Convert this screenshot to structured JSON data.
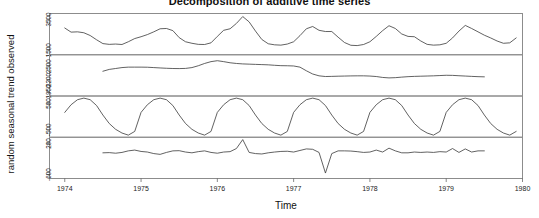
{
  "chart_data": {
    "type": "line",
    "title": "Decomposition of additive time series",
    "xlabel": "Time",
    "ylabel": "random   seasonal   trend   observed",
    "grid": false,
    "legend": "none",
    "xlim": [
      1973.8,
      1980.0
    ],
    "xticks": [
      "1974",
      "1975",
      "1976",
      "1977",
      "1978",
      "1979",
      "1980"
    ],
    "xtick_values": [
      1974,
      1975,
      1976,
      1977,
      1978,
      1979,
      1980
    ],
    "panels": [
      {
        "name": "observed",
        "label": "observed",
        "ylim": [
          1200,
          3900
        ],
        "yticks": [
          1500,
          3500
        ],
        "ytick_labels": [
          "1500",
          "3500"
        ],
        "x": [
          1974.0,
          1974.083,
          1974.167,
          1974.25,
          1974.333,
          1974.417,
          1974.5,
          1974.583,
          1974.667,
          1974.75,
          1974.833,
          1974.917,
          1975.0,
          1975.083,
          1975.167,
          1975.25,
          1975.333,
          1975.417,
          1975.5,
          1975.583,
          1975.667,
          1975.75,
          1975.833,
          1975.917,
          1976.0,
          1976.083,
          1976.167,
          1976.25,
          1976.333,
          1976.417,
          1976.5,
          1976.583,
          1976.667,
          1976.75,
          1976.833,
          1976.917,
          1977.0,
          1977.083,
          1977.167,
          1977.25,
          1977.333,
          1977.417,
          1977.5,
          1977.583,
          1977.667,
          1977.75,
          1977.833,
          1977.917,
          1978.0,
          1978.083,
          1978.167,
          1978.25,
          1978.333,
          1978.417,
          1978.5,
          1978.583,
          1978.667,
          1978.75,
          1978.833,
          1978.917,
          1979.0,
          1979.083,
          1979.167,
          1979.25,
          1979.333,
          1979.417,
          1979.5,
          1979.583,
          1979.667,
          1979.75,
          1979.833,
          1979.917
        ],
        "values": [
          2950,
          2680,
          2700,
          2640,
          2460,
          2180,
          1930,
          1880,
          1900,
          1870,
          2050,
          2260,
          2380,
          2520,
          2700,
          2900,
          2920,
          2780,
          2320,
          2050,
          1950,
          1880,
          1870,
          1980,
          2400,
          2800,
          2900,
          3250,
          3700,
          3350,
          2750,
          2200,
          1920,
          1850,
          1830,
          1900,
          2050,
          2450,
          2900,
          3050,
          2800,
          2720,
          2720,
          2350,
          2000,
          1820,
          1800,
          1870,
          2050,
          2400,
          2780,
          3100,
          2920,
          2560,
          2400,
          2380,
          2100,
          1880,
          1830,
          1850,
          1950,
          2300,
          2750,
          3120,
          2920,
          2700,
          2480,
          2300,
          2100,
          1950,
          1980,
          2300
        ]
      },
      {
        "name": "trend",
        "label": "trend",
        "ylim": [
          1850,
          2750
        ],
        "yticks": [
          1950,
          2200,
          2500
        ],
        "ytick_labels": [
          "1950",
          "2200",
          "2500"
        ],
        "x": [
          1974.5,
          1974.583,
          1974.667,
          1974.75,
          1974.833,
          1974.917,
          1975.0,
          1975.083,
          1975.167,
          1975.25,
          1975.333,
          1975.417,
          1975.5,
          1975.583,
          1975.667,
          1975.75,
          1975.833,
          1975.917,
          1976.0,
          1976.083,
          1976.167,
          1976.25,
          1976.333,
          1976.417,
          1976.5,
          1976.583,
          1976.667,
          1976.75,
          1976.833,
          1976.917,
          1977.0,
          1977.083,
          1977.167,
          1977.25,
          1977.333,
          1977.417,
          1977.5,
          1977.583,
          1977.667,
          1977.75,
          1977.833,
          1977.917,
          1978.0,
          1978.083,
          1978.167,
          1978.25,
          1978.333,
          1978.417,
          1978.5,
          1978.583,
          1978.667,
          1978.75,
          1978.833,
          1978.917,
          1979.0,
          1979.083,
          1979.167,
          1979.25,
          1979.333,
          1979.417,
          1979.5
        ],
        "values": [
          2390,
          2430,
          2450,
          2470,
          2480,
          2480,
          2480,
          2478,
          2470,
          2462,
          2455,
          2450,
          2448,
          2452,
          2470,
          2510,
          2560,
          2600,
          2620,
          2600,
          2575,
          2560,
          2550,
          2545,
          2540,
          2535,
          2530,
          2520,
          2512,
          2510,
          2505,
          2480,
          2400,
          2330,
          2290,
          2275,
          2278,
          2282,
          2285,
          2288,
          2290,
          2290,
          2285,
          2275,
          2255,
          2245,
          2250,
          2262,
          2272,
          2278,
          2282,
          2286,
          2290,
          2296,
          2302,
          2300,
          2292,
          2285,
          2278,
          2272,
          2268
        ]
      },
      {
        "name": "seasonal",
        "label": "seasonal",
        "ylim": [
          -780,
          780
        ],
        "yticks": [
          -500,
          500
        ],
        "ytick_labels": [
          "-500",
          "500"
        ],
        "x": [
          1974.0,
          1974.083,
          1974.167,
          1974.25,
          1974.333,
          1974.417,
          1974.5,
          1974.583,
          1974.667,
          1974.75,
          1974.833,
          1974.917,
          1975.0,
          1975.083,
          1975.167,
          1975.25,
          1975.333,
          1975.417,
          1975.5,
          1975.583,
          1975.667,
          1975.75,
          1975.833,
          1975.917,
          1976.0,
          1976.083,
          1976.167,
          1976.25,
          1976.333,
          1976.417,
          1976.5,
          1976.583,
          1976.667,
          1976.75,
          1976.833,
          1976.917,
          1977.0,
          1977.083,
          1977.167,
          1977.25,
          1977.333,
          1977.417,
          1977.5,
          1977.583,
          1977.667,
          1977.75,
          1977.833,
          1977.917,
          1978.0,
          1978.083,
          1978.167,
          1978.25,
          1978.333,
          1978.417,
          1978.5,
          1978.583,
          1978.667,
          1978.75,
          1978.833,
          1978.917,
          1979.0,
          1979.083,
          1979.167,
          1979.25,
          1979.333,
          1979.417,
          1979.5,
          1979.583,
          1979.667,
          1979.75,
          1979.833,
          1979.917
        ],
        "values": [
          160,
          450,
          640,
          700,
          640,
          420,
          60,
          -260,
          -480,
          -620,
          -700,
          -560,
          160,
          450,
          640,
          700,
          640,
          420,
          60,
          -260,
          -480,
          -620,
          -700,
          -560,
          160,
          450,
          640,
          700,
          640,
          420,
          60,
          -260,
          -480,
          -620,
          -700,
          -560,
          160,
          450,
          640,
          700,
          640,
          420,
          60,
          -260,
          -480,
          -620,
          -700,
          -560,
          160,
          450,
          640,
          700,
          640,
          420,
          60,
          -260,
          -480,
          -620,
          -700,
          -560,
          160,
          450,
          640,
          700,
          640,
          420,
          60,
          -260,
          -480,
          -620,
          -700,
          -560
        ]
      },
      {
        "name": "random",
        "label": "random",
        "ylim": [
          -700,
          360
        ],
        "yticks": [
          -600,
          200
        ],
        "ytick_labels": [
          "-600",
          "200"
        ],
        "x": [
          1974.5,
          1974.583,
          1974.667,
          1974.75,
          1974.833,
          1974.917,
          1975.0,
          1975.083,
          1975.167,
          1975.25,
          1975.333,
          1975.417,
          1975.5,
          1975.583,
          1975.667,
          1975.75,
          1975.833,
          1975.917,
          1976.0,
          1976.083,
          1976.167,
          1976.25,
          1976.333,
          1976.417,
          1976.5,
          1976.583,
          1976.667,
          1976.75,
          1976.833,
          1976.917,
          1977.0,
          1977.083,
          1977.167,
          1977.25,
          1977.333,
          1977.417,
          1977.5,
          1977.583,
          1977.667,
          1977.75,
          1977.833,
          1977.917,
          1978.0,
          1978.083,
          1978.167,
          1978.25,
          1978.333,
          1978.417,
          1978.5,
          1978.583,
          1978.667,
          1978.75,
          1978.833,
          1978.917,
          1979.0,
          1979.083,
          1979.167,
          1979.25,
          1979.333,
          1979.417,
          1979.5
        ],
        "values": [
          -40,
          -35,
          -50,
          -30,
          10,
          30,
          -5,
          -20,
          -60,
          -80,
          -30,
          10,
          15,
          -20,
          -40,
          -10,
          10,
          -30,
          -50,
          -20,
          -10,
          70,
          300,
          -30,
          -60,
          -70,
          -40,
          -20,
          -5,
          0,
          -20,
          20,
          60,
          50,
          -30,
          -560,
          -60,
          10,
          10,
          5,
          -10,
          -30,
          -20,
          30,
          -20,
          80,
          10,
          -40,
          -40,
          -20,
          -30,
          -20,
          -30,
          -10,
          -20,
          70,
          -30,
          60,
          -20,
          10,
          10
        ]
      }
    ]
  }
}
